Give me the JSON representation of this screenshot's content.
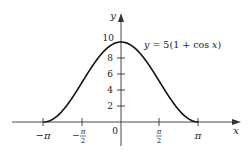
{
  "chart_data": {
    "type": "line",
    "title": "",
    "equation_label": "y = 5(1 + cos x)",
    "xlabel": "x",
    "ylabel": "y",
    "x_ticks": [
      "−π",
      "−π/2",
      "0",
      "π/2",
      "π"
    ],
    "x_tick_values": [
      -3.1416,
      -1.5708,
      0,
      1.5708,
      3.1416
    ],
    "y_ticks": [
      "2",
      "4",
      "6",
      "8",
      "10"
    ],
    "y_tick_values": [
      2,
      4,
      6,
      8,
      10
    ],
    "xlim": [
      -3.1416,
      3.1416
    ],
    "ylim": [
      0,
      10
    ],
    "series": [
      {
        "name": "y = 5(1 + cos x)",
        "x": [
          -3.1416,
          -2.3562,
          -1.5708,
          -0.7854,
          0,
          0.7854,
          1.5708,
          2.3562,
          3.1416
        ],
        "y": [
          0,
          1.46,
          5,
          8.54,
          10,
          8.54,
          5,
          1.46,
          0
        ]
      }
    ],
    "grid": false,
    "legend": "none",
    "colors": {
      "curve": "#111111",
      "axes": "#333333",
      "text": "#222222"
    }
  },
  "labels": {
    "x_axis": "x",
    "y_axis": "y",
    "origin": "0",
    "neg_pi": "−π",
    "neg_pi_half_num": "π",
    "pi_half_num": "π",
    "half_den": "2",
    "pi": "π",
    "y2": "2",
    "y4": "4",
    "y6": "6",
    "y8": "8",
    "y10": "10",
    "equation": "y = 5(1 + cos x)"
  }
}
